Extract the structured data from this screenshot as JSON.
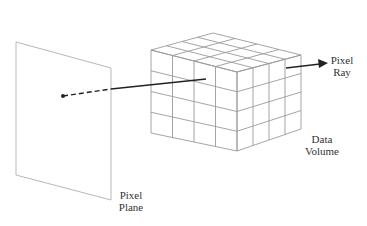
{
  "labels": {
    "pixel_ray": [
      "Pixel",
      "Ray"
    ],
    "data_volume": [
      "Data",
      "Volume"
    ],
    "pixel_plane": [
      "Pixel",
      "Plane"
    ]
  },
  "colors": {
    "grid_line": "#9a9a9a",
    "plane_line": "#b8b8b8",
    "ray": "#222222",
    "text": "#333333"
  },
  "cube": {
    "divisions": 4
  }
}
